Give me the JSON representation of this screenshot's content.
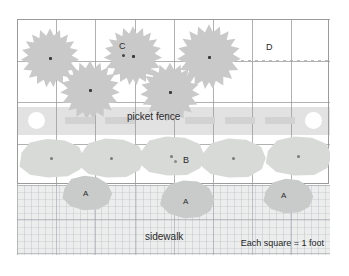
{
  "diagram": {
    "legend": "Each square = 1 foot",
    "labels": {
      "fence": "picket fence",
      "sidewalk": "sidewalk",
      "tree_c": "C",
      "shrub_b": "B",
      "empty_d": "D",
      "plant_a1": "A",
      "plant_a2": "A",
      "plant_a3": "A"
    },
    "scale": {
      "unit": "foot",
      "squares_per_unit": 1
    },
    "grid": {
      "columns": 8,
      "rows": 4,
      "cell_color": "#969896",
      "bed_outline_color": "#9a9c9a"
    },
    "colors": {
      "tree": "#c9c9c9",
      "shrub": "#d8dad8",
      "lowplant": "#c8cbc9",
      "fence_band": "#e2e2e2",
      "picket": "#d2d2d2",
      "sidewalk": "#eceded",
      "background": "#ffffff"
    },
    "bands": [
      {
        "name": "yard",
        "label": ""
      },
      {
        "name": "fence",
        "label": "picket fence"
      },
      {
        "name": "shrub-row",
        "label": "B"
      },
      {
        "name": "sidewalk",
        "label": "sidewalk"
      }
    ],
    "trees": [
      {
        "id": "tree-1",
        "label": ""
      },
      {
        "id": "tree-2",
        "label": ""
      },
      {
        "id": "tree-3",
        "label": "C"
      },
      {
        "id": "tree-4",
        "label": ""
      },
      {
        "id": "tree-5",
        "label": ""
      }
    ],
    "shrubs": [
      {
        "id": "shrub-1",
        "label": ""
      },
      {
        "id": "shrub-2",
        "label": ""
      },
      {
        "id": "shrub-3",
        "label": "B"
      },
      {
        "id": "shrub-4",
        "label": ""
      },
      {
        "id": "shrub-5",
        "label": ""
      }
    ],
    "lowplants": [
      {
        "id": "lowplant-1",
        "label": "A"
      },
      {
        "id": "lowplant-2",
        "label": "A"
      },
      {
        "id": "lowplant-3",
        "label": "A"
      }
    ]
  }
}
